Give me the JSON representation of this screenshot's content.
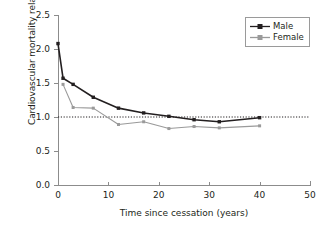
{
  "chart_data": {
    "type": "line",
    "title": "",
    "xlabel": "Time since cessation (years)",
    "ylabel": "Cardiovascular mortality relative risk",
    "xlim": [
      0,
      50
    ],
    "ylim": [
      0.0,
      2.5
    ],
    "xticks": [
      "0",
      "10",
      "20",
      "30",
      "40",
      "50"
    ],
    "xtick_values": [
      0,
      10,
      20,
      30,
      40,
      50
    ],
    "yticks": [
      "0.0",
      "0.5",
      "1.0",
      "1.5",
      "2.0",
      "2.5"
    ],
    "ytick_values": [
      0.0,
      0.5,
      1.0,
      1.5,
      2.0,
      2.5
    ],
    "grid": false,
    "legend_position": "top-right",
    "reference_line": {
      "y": 1.0,
      "style": "dotted",
      "color": "#231f20"
    },
    "series": [
      {
        "name": "Male",
        "color": "#231f20",
        "marker": "square",
        "x": [
          0,
          1,
          3,
          7,
          12,
          17,
          22,
          27,
          32,
          40
        ],
        "values": [
          2.08,
          1.57,
          1.48,
          1.29,
          1.13,
          1.06,
          1.01,
          0.96,
          0.93,
          0.99
        ]
      },
      {
        "name": "Female",
        "color": "#9a9a9a",
        "marker": "square",
        "x": [
          1,
          3,
          7,
          12,
          17,
          22,
          27,
          32,
          40
        ],
        "values": [
          1.48,
          1.14,
          1.13,
          0.89,
          0.93,
          0.83,
          0.86,
          0.84,
          0.87
        ]
      }
    ]
  },
  "legend": {
    "entries": [
      {
        "label": "Male"
      },
      {
        "label": "Female"
      }
    ]
  }
}
